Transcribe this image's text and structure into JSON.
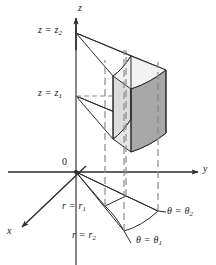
{
  "figure": {
    "type": "cylindrical-coordinates-volume-element",
    "title": "",
    "background_color": "#ffffff",
    "line_color": "#2b2b2b",
    "dashed_color": "#8a8a8a",
    "solid_face_light": "#dcdcdc",
    "solid_face_top": "#f2f2f2",
    "solid_face_dark": "#a8a8a8",
    "axes": [
      {
        "name": "z-axis",
        "label": "z",
        "direction": "up",
        "label_pos": {
          "x": 78,
          "y": 6
        }
      },
      {
        "name": "y-axis",
        "label": "y",
        "direction": "right",
        "label_pos": {
          "x": 203,
          "y": 165
        }
      },
      {
        "name": "x-axis",
        "label": "x",
        "direction": "down-left",
        "label_pos": {
          "x": 8,
          "y": 228
        }
      }
    ],
    "origin": {
      "label": "0",
      "label_pos": {
        "x": 63,
        "y": 159
      },
      "point": {
        "x": 76,
        "y": 172
      }
    },
    "annotations": [
      {
        "name": "z-upper-bound",
        "text_html": "z = z<sub>2</sub>",
        "text": "z = z2",
        "pos": {
          "x": 38,
          "y": 26
        },
        "anchor_point": {
          "x": 76,
          "y": 33
        }
      },
      {
        "name": "z-lower-bound",
        "text_html": "z = z<sub>1</sub>",
        "text": "z = z1",
        "pos": {
          "x": 38,
          "y": 89
        },
        "anchor_point": {
          "x": 76,
          "y": 96
        }
      },
      {
        "name": "r-inner-bound",
        "text_html": "r = r<sub>1</sub>",
        "text": "r = r1",
        "pos": {
          "x": 63,
          "y": 203
        },
        "anchor_point": {
          "x": 105,
          "y": 206
        }
      },
      {
        "name": "r-outer-bound",
        "text_html": "r = r<sub>2</sub>",
        "text": "r = r2",
        "pos": {
          "x": 73,
          "y": 232
        },
        "anchor_point": {
          "x": 124,
          "y": 231
        }
      },
      {
        "name": "theta-lower-bound",
        "text_html": "θ = θ<sub>1</sub>",
        "text": "theta = theta1",
        "pos": {
          "x": 135,
          "y": 236
        },
        "anchor_point": {
          "x": 130,
          "y": 236
        }
      },
      {
        "name": "theta-upper-bound",
        "text_html": "θ = θ<sub>2</sub>",
        "text": "theta = theta2",
        "pos": {
          "x": 165,
          "y": 209
        },
        "anchor_point": {
          "x": 158,
          "y": 211
        }
      }
    ],
    "solid": {
      "name": "volume-element-solid",
      "description": "cylindrical wedge between r1 and r2, theta1 and theta2, z1 and z2",
      "faces": [
        {
          "name": "top-face",
          "fill": "#f2f2f2"
        },
        {
          "name": "left-front-face",
          "fill": "#dcdcdc"
        },
        {
          "name": "right-outer-face",
          "fill": "#a8a8a8"
        },
        {
          "name": "bottom-face",
          "fill": "#e6e6e6"
        }
      ]
    },
    "base_region": {
      "name": "base-projection-region",
      "description": "annular sector projection in the xy-plane"
    }
  }
}
